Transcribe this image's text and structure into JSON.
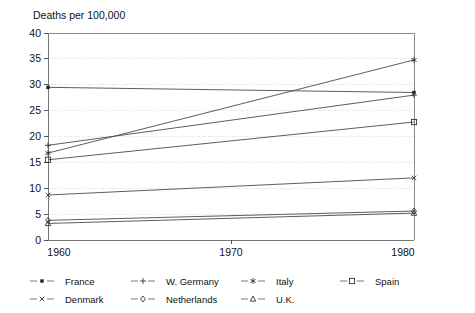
{
  "chart_data": {
    "type": "line",
    "title": "Deaths per 100,000",
    "xlabel": "",
    "ylabel": "",
    "x": [
      1960,
      1980
    ],
    "xlim": [
      1960,
      1980
    ],
    "ylim": [
      0,
      40
    ],
    "xticks": [
      "1960",
      "1970",
      "1980"
    ],
    "xtick_values": [
      1960,
      1970,
      1980
    ],
    "yticks": [
      "0",
      "5",
      "10",
      "15",
      "20",
      "25",
      "30",
      "35",
      "40"
    ],
    "ytick_values": [
      0,
      5,
      10,
      15,
      20,
      25,
      30,
      35,
      40
    ],
    "grid": "horizontal-dotted",
    "legend_position": "bottom",
    "series": [
      {
        "name": "France",
        "marker": "filled-square",
        "values": [
          29.5,
          28.5
        ]
      },
      {
        "name": "W. Germany",
        "marker": "plus",
        "values": [
          18.3,
          28.0
        ]
      },
      {
        "name": "Italy",
        "marker": "asterisk",
        "values": [
          16.8,
          34.8
        ]
      },
      {
        "name": "Spain",
        "marker": "open-square",
        "values": [
          15.5,
          22.8
        ]
      },
      {
        "name": "Denmark",
        "marker": "cross-x",
        "values": [
          8.7,
          12.0
        ]
      },
      {
        "name": "Netherlands",
        "marker": "open-diamond",
        "values": [
          3.8,
          5.6
        ]
      },
      {
        "name": "U.K.",
        "marker": "open-triangle",
        "values": [
          3.2,
          5.2
        ]
      }
    ]
  },
  "title": {
    "text": "Deaths per 100,000"
  },
  "axes": {
    "y": {
      "labels": [
        "40",
        "35",
        "30",
        "25",
        "20",
        "15",
        "10",
        "5",
        "0"
      ]
    },
    "x": {
      "labels": [
        "1960",
        "1970",
        "1980"
      ]
    }
  },
  "legend": {
    "entries": [
      {
        "label": "France",
        "marker": "filled-square-marker"
      },
      {
        "label": "W. Germany",
        "marker": "plus-marker"
      },
      {
        "label": "Italy",
        "marker": "asterisk-marker"
      },
      {
        "label": "Spain",
        "marker": "open-square-marker"
      },
      {
        "label": "Denmark",
        "marker": "cross-x-marker"
      },
      {
        "label": "Netherlands",
        "marker": "open-diamond-marker"
      },
      {
        "label": "U.K.",
        "marker": "open-triangle-marker"
      }
    ]
  },
  "colors": {
    "line": "#4b4b4b",
    "axis": "#777777",
    "grid": "#c9c9c9",
    "text": "#111111",
    "background": "#ffffff"
  }
}
